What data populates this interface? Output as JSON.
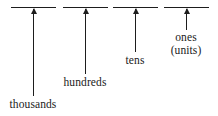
{
  "figure": {
    "type": "place-value-diagram",
    "background_color": "#ffffff",
    "ink_color": "#1d1d1d",
    "width": 218,
    "height": 116
  },
  "places": [
    {
      "id": "thousands",
      "label": "thousands",
      "label_lines": [
        "thousands"
      ],
      "line": {
        "x": 11,
        "y": 7,
        "width": 45
      },
      "arrow": {
        "x": 33,
        "top": 9,
        "bottom": 96
      },
      "label_pos": {
        "x": 33,
        "y": 98
      }
    },
    {
      "id": "hundreds",
      "label": "hundreds",
      "label_lines": [
        "hundreds"
      ],
      "line": {
        "x": 63,
        "y": 7,
        "width": 45
      },
      "arrow": {
        "x": 85,
        "top": 9,
        "bottom": 74
      },
      "label_pos": {
        "x": 85,
        "y": 76
      }
    },
    {
      "id": "tens",
      "label": "tens",
      "label_lines": [
        "tens"
      ],
      "line": {
        "x": 113,
        "y": 7,
        "width": 45
      },
      "arrow": {
        "x": 135,
        "top": 9,
        "bottom": 52
      },
      "label_pos": {
        "x": 135,
        "y": 54
      }
    },
    {
      "id": "ones",
      "label": "ones (units)",
      "label_lines": [
        "ones",
        "(units)"
      ],
      "line": {
        "x": 164,
        "y": 7,
        "width": 45
      },
      "arrow": {
        "x": 186,
        "top": 9,
        "bottom": 30
      },
      "label_pos": {
        "x": 186,
        "y": 31
      }
    }
  ]
}
